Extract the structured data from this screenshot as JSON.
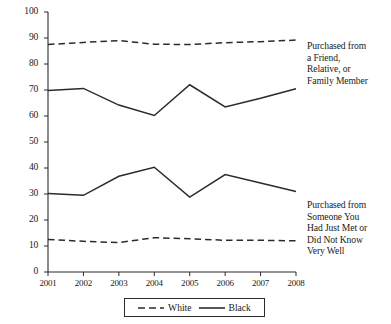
{
  "chart_data": {
    "type": "line",
    "title": "",
    "xlabel": "",
    "ylabel": "",
    "x": [
      2001,
      2002,
      2003,
      2004,
      2005,
      2006,
      2007,
      2008
    ],
    "xtick_labels": [
      "2001",
      "2002",
      "2003",
      "2004",
      "2005",
      "2006",
      "2007",
      "2008"
    ],
    "ytick_labels": [
      "0",
      "10",
      "20",
      "30",
      "40",
      "50",
      "60",
      "70",
      "80",
      "90",
      "100"
    ],
    "ytick_values": [
      0,
      10,
      20,
      30,
      40,
      50,
      60,
      70,
      80,
      90,
      100
    ],
    "ylim": [
      0,
      100
    ],
    "xlim": [
      2001,
      2008
    ],
    "grid": false,
    "legend_position": "bottom-center",
    "legend": [
      "White",
      "Black"
    ],
    "series": [
      {
        "name": "White",
        "group": "Purchased from a Friend, Relative, or Family Member",
        "style": "dashed",
        "color": "#2b2b2b",
        "values": [
          87.5,
          88.3,
          89.0,
          87.6,
          87.5,
          88.2,
          88.6,
          89.2
        ]
      },
      {
        "name": "Black",
        "group": "Purchased from a Friend, Relative, or Family Member",
        "style": "solid",
        "color": "#2b2b2b",
        "values": [
          69.8,
          70.6,
          64.2,
          60.2,
          72.0,
          63.5,
          66.8,
          70.5
        ]
      },
      {
        "name": "Black",
        "group": "Purchased from Someone You Had Just Met or Did Not Know Very Well",
        "style": "solid",
        "color": "#2b2b2b",
        "values": [
          30.2,
          29.5,
          36.8,
          40.3,
          28.8,
          37.5,
          34.2,
          31.0
        ]
      },
      {
        "name": "White",
        "group": "Purchased from Someone You Had Just Met or Did Not Know Very Well",
        "style": "dashed",
        "color": "#2b2b2b",
        "values": [
          12.5,
          11.8,
          11.3,
          13.2,
          12.8,
          12.2,
          12.2,
          12.0
        ]
      }
    ],
    "annotations": [
      {
        "id": "friend",
        "text": "Purchased from a Friend, Relative, or Family Member",
        "lines": [
          "Purchased from",
          "a Friend,",
          "Relative, or",
          "Family Member"
        ]
      },
      {
        "id": "stranger",
        "text": "Purchased from Someone You Had Just Met or Did Not Know Very Well",
        "lines": [
          "Purchased from",
          "Someone You",
          "Had Just Met or",
          "Did Not Know",
          "Very Well"
        ]
      }
    ]
  },
  "axis": {
    "y_ticks": [
      {
        "label": "100",
        "value": 100
      },
      {
        "label": "90",
        "value": 90
      },
      {
        "label": "80",
        "value": 80
      },
      {
        "label": "70",
        "value": 70
      },
      {
        "label": "60",
        "value": 60
      },
      {
        "label": "50",
        "value": 50
      },
      {
        "label": "40",
        "value": 40
      },
      {
        "label": "30",
        "value": 30
      },
      {
        "label": "20",
        "value": 20
      },
      {
        "label": "10",
        "value": 10
      },
      {
        "label": "0",
        "value": 0
      }
    ],
    "x_ticks": [
      {
        "label": "2001"
      },
      {
        "label": "2002"
      },
      {
        "label": "2003"
      },
      {
        "label": "2004"
      },
      {
        "label": "2005"
      },
      {
        "label": "2006"
      },
      {
        "label": "2007"
      },
      {
        "label": "2008"
      }
    ]
  },
  "legend": {
    "white_label": "White",
    "black_label": "Black"
  },
  "annotations": {
    "friend": {
      "line1": "Purchased from",
      "line2": "a Friend,",
      "line3": "Relative, or",
      "line4": "Family Member"
    },
    "stranger": {
      "line1": "Purchased from",
      "line2": "Someone You",
      "line3": "Had Just Met or",
      "line4": "Did Not Know",
      "line5": "Very Well"
    }
  },
  "colors": {
    "line": "#2b2b2b",
    "axis": "#2b2b2b",
    "background": "#ffffff"
  }
}
